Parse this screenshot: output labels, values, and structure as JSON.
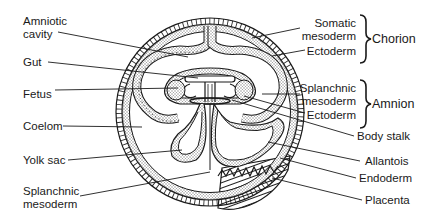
{
  "diagram": {
    "title": "",
    "left_labels": {
      "amniotic_cavity_1": "Amniotic",
      "amniotic_cavity_2": "cavity",
      "gut": "Gut",
      "fetus": "Fetus",
      "coelom": "Coelom",
      "yolk_sac": "Yolk sac",
      "splanchnic_mesoderm_1": "Splanchnic",
      "splanchnic_mesoderm_2": "mesoderm"
    },
    "right_labels": {
      "somatic_mesoderm_1": "Somatic",
      "somatic_mesoderm_2": "mesoderm",
      "chorion_ectoderm": "Ectoderm",
      "chorion_group": "Chorion",
      "splanchnic_mesoderm_1": "Splanchnic",
      "splanchnic_mesoderm_2": "mesoderm",
      "amnion_ectoderm": "Ectoderm",
      "amnion_group": "Amnion",
      "body_stalk": "Body stalk",
      "allantois": "Allantois",
      "endoderm": "Endoderm",
      "placenta": "Placenta"
    },
    "colors": {
      "line": "#1a1a1a",
      "stipple": "#bdbdbd",
      "background": "#ffffff"
    }
  }
}
